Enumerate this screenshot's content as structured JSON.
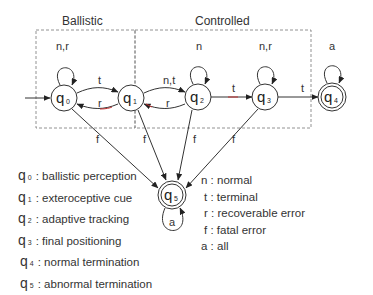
{
  "groups": [
    {
      "id": "ballistic",
      "label": "Ballistic"
    },
    {
      "id": "controlled",
      "label": "Controlled"
    }
  ],
  "states": [
    {
      "id": "q0",
      "main": "q",
      "sub": "0",
      "accepting": false,
      "initial": true
    },
    {
      "id": "q1",
      "main": "q",
      "sub": "1",
      "accepting": false
    },
    {
      "id": "q2",
      "main": "q",
      "sub": "2",
      "accepting": false
    },
    {
      "id": "q3",
      "main": "q",
      "sub": "3",
      "accepting": false
    },
    {
      "id": "q4",
      "main": "q",
      "sub": "4",
      "accepting": true
    },
    {
      "id": "q5",
      "main": "q",
      "sub": "5",
      "accepting": true
    }
  ],
  "transitions": [
    {
      "from": "q0",
      "to": "q0",
      "label": "n,r"
    },
    {
      "from": "q0",
      "to": "q1",
      "label": "t"
    },
    {
      "from": "q1",
      "to": "q0",
      "label": "r"
    },
    {
      "from": "q1",
      "to": "q2",
      "label": "n,t"
    },
    {
      "from": "q2",
      "to": "q1",
      "label": "r"
    },
    {
      "from": "q2",
      "to": "q2",
      "label": "n"
    },
    {
      "from": "q2",
      "to": "q3",
      "label": "t"
    },
    {
      "from": "q3",
      "to": "q3",
      "label": "n,r"
    },
    {
      "from": "q3",
      "to": "q4",
      "label": "t"
    },
    {
      "from": "q4",
      "to": "q4",
      "label": "a"
    },
    {
      "from": "q0",
      "to": "q5",
      "label": "f"
    },
    {
      "from": "q1",
      "to": "q5",
      "label": "f"
    },
    {
      "from": "q2",
      "to": "q5",
      "label": "f"
    },
    {
      "from": "q3",
      "to": "q5",
      "label": "f"
    },
    {
      "from": "q5",
      "to": "q5",
      "label": "a"
    }
  ],
  "state_legend": [
    {
      "main": "q",
      "sub": "0",
      "desc": ": ballistic perception"
    },
    {
      "main": "q",
      "sub": "1",
      "desc": ": exteroceptive cue"
    },
    {
      "main": "q",
      "sub": "2",
      "desc": ": adaptive tracking"
    },
    {
      "main": "q",
      "sub": "3",
      "desc": ": final positioning"
    },
    {
      "main": "q",
      "sub": "4",
      "desc": ": normal termination"
    },
    {
      "main": "q",
      "sub": "5",
      "desc": ": abnormal termination"
    }
  ],
  "input_legend": [
    {
      "key": "n",
      "desc": ": normal"
    },
    {
      "key": "t",
      "desc": ": terminal"
    },
    {
      "key": "r",
      "desc": ": recoverable error"
    },
    {
      "key": "f",
      "desc": ": fatal error"
    },
    {
      "key": "a",
      "desc": ": all"
    }
  ]
}
